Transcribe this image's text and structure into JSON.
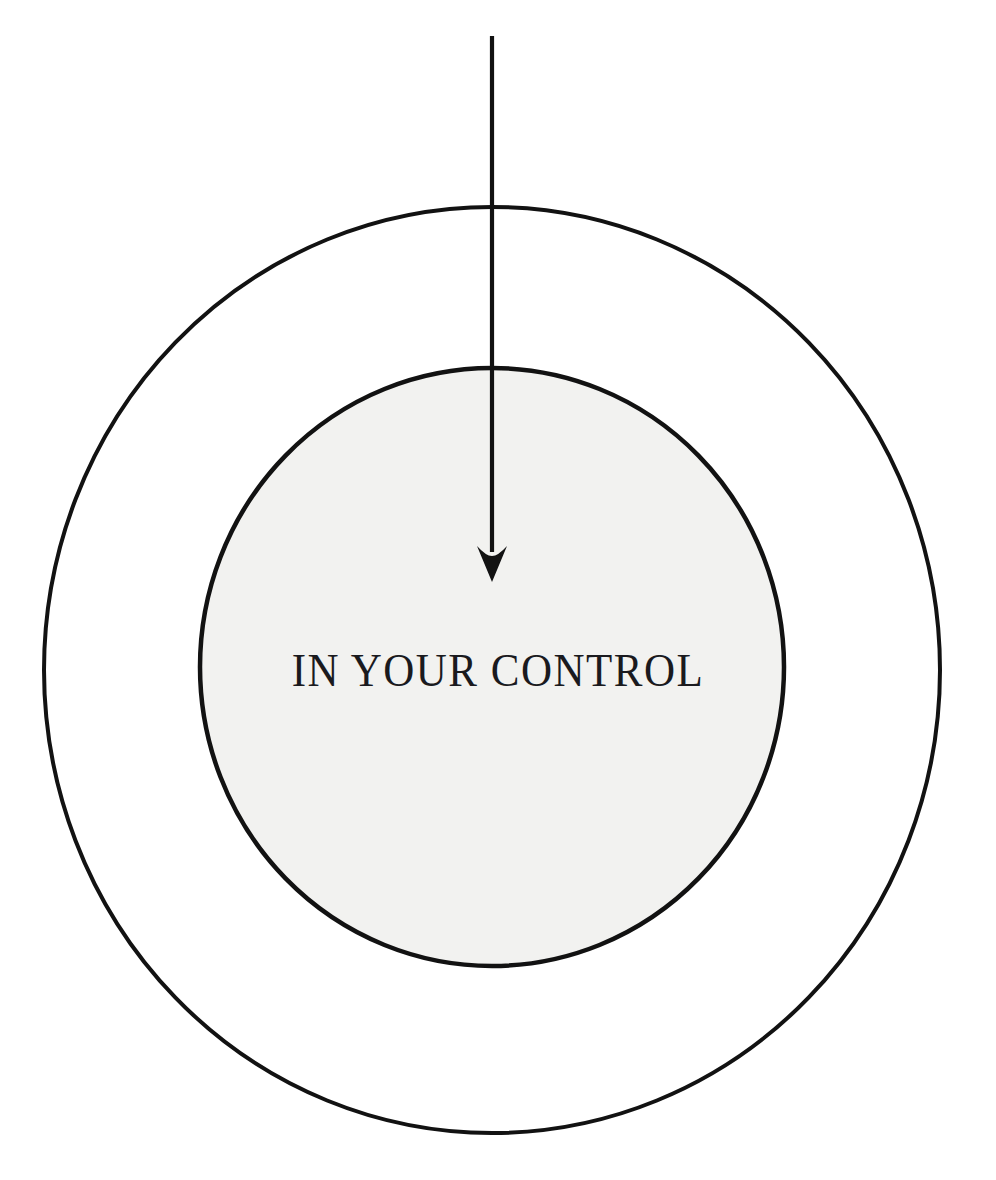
{
  "canvas": {
    "width": 996,
    "height": 1180,
    "background_color": "#ffffff"
  },
  "diagram": {
    "type": "concentric-circles-with-arrow",
    "title_text": "IN YOUR CONTROL",
    "stroke_color": "#121212",
    "inner_fill_color": "#f2f2f0",
    "outer_fill_color": "#ffffff",
    "outer_circle": {
      "name": "outer-ring",
      "center_x": 492,
      "center_y": 670,
      "radius_x": 448,
      "radius_y": 463,
      "stroke_width": 4,
      "fill": "none"
    },
    "inner_circle": {
      "name": "inner-disc",
      "center_x": 492,
      "center_y": 667,
      "radius_x": 292,
      "radius_y": 299,
      "stroke_width": 4.5,
      "fill": "#f2f2f0"
    },
    "arrow": {
      "name": "downward-arrow",
      "start_x": 492,
      "start_y": 36,
      "end_x": 492,
      "end_y": 582,
      "shaft_width": 4.2,
      "head_width": 30,
      "head_length": 36,
      "direction": "down",
      "color": "#121212"
    },
    "label": {
      "text": "IN YOUR CONTROL",
      "center_x": 495,
      "baseline_y": 690,
      "font_size_px": 43,
      "letter_spacing_px": 1.5,
      "color": "#1a1a1e"
    }
  }
}
